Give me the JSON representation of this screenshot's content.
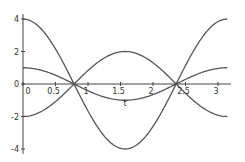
{
  "chart_data": {
    "type": "line",
    "title": "",
    "xlabel": "t",
    "ylabel": "",
    "xlim": [
      0,
      3.1416
    ],
    "ylim": [
      -4,
      4
    ],
    "grid": false,
    "legend": null,
    "x_ticks": [
      0,
      0.5,
      1,
      1.5,
      2,
      2.5,
      3
    ],
    "x_tick_labels": [
      "0",
      "0.5",
      "1",
      "1.5",
      "2",
      "2.5",
      "3"
    ],
    "y_ticks": [
      -4,
      -2,
      0,
      2,
      4
    ],
    "y_tick_labels": [
      "-4",
      "-2",
      "0",
      "2",
      "4"
    ],
    "series": [
      {
        "name": "4cos(2t)",
        "x": [
          0,
          0.3927,
          0.7854,
          1.1781,
          1.5708,
          1.9635,
          2.3562,
          2.7489,
          3.1416
        ],
        "values": [
          4,
          2.83,
          0,
          -2.83,
          -4,
          -2.83,
          0,
          2.83,
          4
        ]
      },
      {
        "name": "-2cos(2t)",
        "x": [
          0,
          0.3927,
          0.7854,
          1.1781,
          1.5708,
          1.9635,
          2.3562,
          2.7489,
          3.1416
        ],
        "values": [
          -2,
          -1.41,
          0,
          1.41,
          2,
          1.41,
          0,
          -1.41,
          -2
        ]
      },
      {
        "name": "cos(2t)",
        "x": [
          0,
          0.3927,
          0.7854,
          1.1781,
          1.5708,
          1.9635,
          2.3562,
          2.7489,
          3.1416
        ],
        "values": [
          1,
          0.71,
          0,
          -0.71,
          -1,
          -0.71,
          0,
          0.71,
          1
        ]
      }
    ],
    "series_functions": [
      {
        "amplitude": 4,
        "freq": 2
      },
      {
        "amplitude": -2,
        "freq": 2
      },
      {
        "amplitude": 1,
        "freq": 2
      }
    ],
    "colors": {
      "line": "#555555",
      "axis": "#444444",
      "text": "#333333",
      "background": "#ffffff"
    }
  }
}
